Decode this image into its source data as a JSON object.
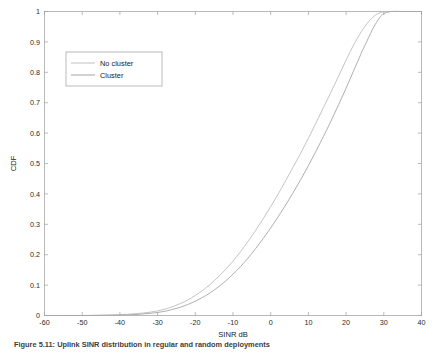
{
  "figure": {
    "caption": "Figure 5.11: Uplink SINR distribution in regular and random deployments"
  },
  "chart_data": {
    "type": "line",
    "title": "",
    "xlabel": "SINR dB",
    "ylabel": "CDF",
    "xlim": [
      -60,
      40
    ],
    "ylim": [
      0,
      1
    ],
    "xticks": [
      -60,
      -50,
      -40,
      -30,
      -20,
      -10,
      0,
      10,
      20,
      30,
      40
    ],
    "xticklabels": [
      "-60",
      "-50",
      "-40",
      "-30",
      "-20",
      "-10",
      "0",
      "10",
      "20",
      "30",
      "40"
    ],
    "yticks": [
      0,
      0.1,
      0.2,
      0.3,
      0.4,
      0.5,
      0.6,
      0.7,
      0.8,
      0.9,
      1
    ],
    "yticklabels": [
      "0",
      "0.1",
      "0.2",
      "0.3",
      "0.4",
      "0.5",
      "0.6",
      "0.7",
      "0.8",
      "0.9",
      "1"
    ],
    "grid": false,
    "box": true,
    "legend": {
      "position": "upper-left",
      "entries": [
        {
          "name": "No cluster",
          "color": "#b9b9b9"
        },
        {
          "name": "Cluster",
          "color": "#9a9a9a"
        }
      ]
    },
    "series": [
      {
        "name": "No cluster",
        "color": "#bdbdbd",
        "width": 0.9,
        "x": [
          -60,
          -55,
          -50,
          -45,
          -42,
          -40,
          -38,
          -36,
          -34,
          -32,
          -30,
          -28,
          -26,
          -24,
          -22,
          -20,
          -18,
          -16,
          -14,
          -12,
          -10,
          -8,
          -6,
          -4,
          -2,
          0,
          2,
          4,
          6,
          8,
          10,
          12,
          14,
          16,
          18,
          20,
          22,
          24,
          25,
          26,
          27,
          28,
          29,
          30,
          32,
          35,
          40
        ],
        "y": [
          0.0,
          0.0,
          0.0,
          0.001,
          0.002,
          0.003,
          0.004,
          0.006,
          0.008,
          0.011,
          0.015,
          0.021,
          0.029,
          0.039,
          0.051,
          0.066,
          0.083,
          0.103,
          0.126,
          0.151,
          0.179,
          0.21,
          0.244,
          0.28,
          0.318,
          0.358,
          0.4,
          0.444,
          0.489,
          0.535,
          0.583,
          0.633,
          0.684,
          0.735,
          0.787,
          0.84,
          0.89,
          0.933,
          0.951,
          0.967,
          0.98,
          0.99,
          0.996,
          0.999,
          1.0,
          1.0,
          1.0
        ]
      },
      {
        "name": "Cluster",
        "color": "#a6a6a6",
        "width": 0.9,
        "x": [
          -60,
          -55,
          -50,
          -45,
          -42,
          -40,
          -38,
          -36,
          -34,
          -32,
          -30,
          -28,
          -26,
          -24,
          -22,
          -20,
          -18,
          -16,
          -14,
          -12,
          -10,
          -8,
          -6,
          -4,
          -2,
          0,
          2,
          4,
          6,
          8,
          10,
          12,
          14,
          16,
          18,
          20,
          22,
          24,
          25,
          26,
          27,
          28,
          29,
          30,
          32,
          35,
          40
        ],
        "y": [
          0.0,
          0.0,
          0.0,
          0.0005,
          0.001,
          0.0015,
          0.002,
          0.003,
          0.005,
          0.007,
          0.01,
          0.014,
          0.02,
          0.027,
          0.036,
          0.047,
          0.06,
          0.075,
          0.093,
          0.113,
          0.136,
          0.161,
          0.189,
          0.22,
          0.253,
          0.288,
          0.325,
          0.364,
          0.405,
          0.448,
          0.493,
          0.54,
          0.589,
          0.64,
          0.693,
          0.748,
          0.805,
          0.862,
          0.889,
          0.915,
          0.941,
          0.963,
          0.981,
          0.993,
          1.0,
          1.0,
          1.0
        ]
      }
    ]
  },
  "legend_box": {
    "x": 66,
    "y": 52,
    "width": 96,
    "height": 34
  }
}
